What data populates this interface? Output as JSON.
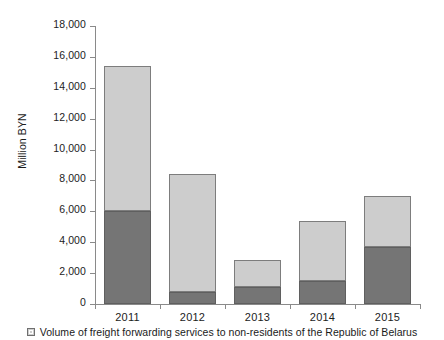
{
  "chart_data": {
    "type": "bar",
    "title": "",
    "subtitle": "",
    "xlabel": "",
    "ylabel": "Million BYN",
    "categories": [
      "2011",
      "2012",
      "2013",
      "2014",
      "2015"
    ],
    "ylim": [
      0,
      18000
    ],
    "ytick_step": 2000,
    "ytick_labels": [
      "0",
      "2,000",
      "4,000",
      "6,000",
      "8,000",
      "10,000",
      "12,000",
      "14,000",
      "16,000",
      "18,000"
    ],
    "ytick_values": [
      0,
      2000,
      4000,
      6000,
      8000,
      10000,
      12000,
      14000,
      16000,
      18000
    ],
    "grid": false,
    "stacked": true,
    "legend_position": "bottom",
    "series": [
      {
        "name": "Volume of freight forwarding services to non-residents of the Republic of Belarus",
        "color": "#cdcdcd",
        "values": [
          9400,
          7640,
          1750,
          3890,
          3310
        ]
      },
      {
        "name": "",
        "color": "#757575",
        "values": [
          6020,
          780,
          1100,
          1490,
          3690
        ]
      }
    ],
    "totals": [
      15420,
      8420,
      2850,
      5380,
      7000
    ],
    "annotations": []
  },
  "legend": {
    "items": [
      {
        "label": "Volume of freight forwarding services to non-residents of the Republic of Belarus",
        "swatch_color": "#cdcdcd",
        "marker": "square-swatch-icon"
      }
    ]
  },
  "axis": {
    "y_title": "Million BYN"
  }
}
